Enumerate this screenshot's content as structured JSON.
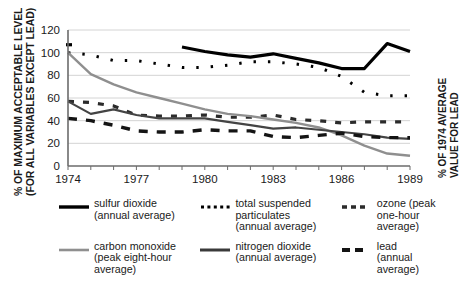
{
  "axes": {
    "y_left_title_line1": "% OF MAXIMUM ACCEPTABLE LEVEL",
    "y_left_title_line2": "(FOR ALL VARIABLES EXCEPT LEAD)",
    "y_right_title_line1": "% OF 1974 AVERAGE",
    "y_right_title_line2": "VALUE FOR LEAD"
  },
  "legend": {
    "items": [
      {
        "key": "sulfur-dioxide",
        "line1": "sulfur dioxide",
        "line2": "(annual average)",
        "line3": "",
        "style": "solid-thick",
        "color": "#000000"
      },
      {
        "key": "total-suspended-particulates",
        "line1": "total suspended",
        "line2": "particulates",
        "line3": "(annual average)",
        "style": "dotted",
        "color": "#000000"
      },
      {
        "key": "ozone",
        "line1": "ozone (peak",
        "line2": "one-hour average)",
        "line3": "",
        "style": "dash-small",
        "color": "#2b2b2b"
      },
      {
        "key": "carbon-monoxide",
        "line1": "carbon monoxide",
        "line2": "(peak eight-hour",
        "line3": "average)",
        "style": "solid-gray",
        "color": "#8f8f8f"
      },
      {
        "key": "nitrogen-dioxide",
        "line1": "nitrogen dioxide",
        "line2": "(annual average)",
        "line3": "",
        "style": "solid-medium",
        "color": "#444444"
      },
      {
        "key": "lead",
        "line1": "lead",
        "line2": "(annual average)",
        "line3": "",
        "style": "dash-large",
        "color": "#141414"
      }
    ]
  },
  "chart_data": {
    "type": "line",
    "title": "",
    "xlabel": "",
    "ylabel": "% OF MAXIMUM ACCEPTABLE LEVEL (FOR ALL VARIABLES EXCEPT LEAD)",
    "ylabel_right": "% OF 1974 AVERAGE VALUE FOR LEAD",
    "grid": true,
    "legend_position": "below",
    "x": [
      1974,
      1975,
      1976,
      1977,
      1978,
      1979,
      1980,
      1981,
      1982,
      1983,
      1984,
      1985,
      1986,
      1987,
      1988,
      1989
    ],
    "xlim": [
      1974,
      1989
    ],
    "xticks": [
      1974,
      1975,
      1976,
      1977,
      1978,
      1979,
      1980,
      1981,
      1982,
      1983,
      1984,
      1985,
      1986,
      1987,
      1988,
      1989
    ],
    "xtick_labels": [
      "1974",
      "",
      "",
      "1977",
      "",
      "",
      "1980",
      "",
      "",
      "1983",
      "",
      "",
      "1986",
      "",
      "",
      "1989"
    ],
    "ylim": [
      0,
      120
    ],
    "yticks": [
      0,
      20,
      40,
      60,
      80,
      100,
      120
    ],
    "ytick_labels": [
      "0",
      "20",
      "40",
      "60",
      "80",
      "100",
      "120"
    ],
    "series": [
      {
        "name": "sulfur dioxide (annual average)",
        "style": "solid-thick",
        "color": "#000000",
        "values": [
          107,
          null,
          null,
          null,
          null,
          105,
          101,
          98,
          96,
          99,
          95,
          91,
          86,
          86,
          108,
          101
        ]
      },
      {
        "name": "total suspended particulates (annual average)",
        "style": "dotted",
        "color": "#000000",
        "values": [
          100,
          98,
          93,
          93,
          90,
          87,
          87,
          89,
          92,
          92,
          90,
          87,
          79,
          65,
          62,
          62
        ]
      },
      {
        "name": "ozone (peak one-hour average)",
        "style": "dash-small",
        "color": "#2b2b2b",
        "values": [
          57,
          56,
          53,
          45,
          44,
          44,
          45,
          43,
          43,
          45,
          41,
          40,
          38,
          39,
          39,
          39
        ]
      },
      {
        "name": "carbon monoxide (peak eight-hour average)",
        "style": "solid-gray",
        "color": "#8f8f8f",
        "values": [
          100,
          81,
          72,
          65,
          60,
          55,
          50,
          46,
          44,
          41,
          38,
          34,
          27,
          18,
          11,
          9
        ]
      },
      {
        "name": "nitrogen dioxide (annual average)",
        "style": "solid-medium",
        "color": "#444444",
        "values": [
          57,
          46,
          50,
          45,
          42,
          42,
          42,
          39,
          36,
          33,
          34,
          32,
          30,
          28,
          25,
          24
        ]
      },
      {
        "name": "lead (annual average)",
        "style": "dash-large",
        "color": "#141414",
        "values": [
          42,
          40,
          36,
          31,
          30,
          30,
          32,
          31,
          31,
          26,
          25,
          27,
          29,
          26,
          25,
          25
        ]
      }
    ]
  }
}
